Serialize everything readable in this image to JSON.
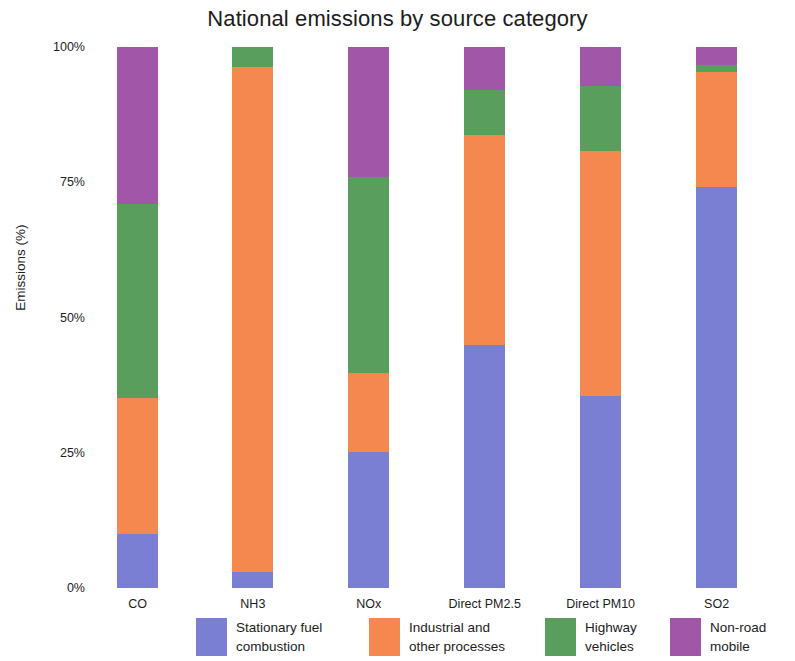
{
  "chart_data": {
    "type": "bar",
    "title": "National emissions by source category",
    "xlabel": "",
    "ylabel": "Emissions (%)",
    "stacked": true,
    "stack_mode": "percent",
    "grid": false,
    "legend_position": "bottom",
    "ylim": [
      0,
      100
    ],
    "yticks": [
      0,
      25,
      50,
      75,
      100
    ],
    "ytick_labels": [
      "0%",
      "25%",
      "50%",
      "75%",
      "100%"
    ],
    "categories": [
      "CO",
      "NH3",
      "NOx",
      "Direct PM2.5",
      "Direct PM10",
      "SO2"
    ],
    "series": [
      {
        "name": "Stationary fuel\ncombustion",
        "legend_label": "Stationary fuel\ncombustion",
        "color": "#7b7fd4",
        "values": [
          10.0,
          3.0,
          25.2,
          44.9,
          35.5,
          74.1
        ]
      },
      {
        "name": "Industrial and\nother processes",
        "legend_label": "Industrial and\nother processes",
        "color": "#f5884f",
        "values": [
          25.2,
          93.3,
          14.6,
          38.8,
          45.3,
          21.2
        ]
      },
      {
        "name": "Highway\nvehicles",
        "legend_label": "Highway\nvehicles",
        "color": "#5a9e5e",
        "values": [
          35.7,
          3.7,
          36.1,
          8.3,
          12.0,
          1.3
        ]
      },
      {
        "name": "Non-road\nmobile",
        "legend_label": "Non-road\nmobile",
        "color": "#a256a8",
        "values": [
          29.1,
          0.0,
          24.1,
          8.0,
          7.2,
          3.4
        ]
      }
    ]
  }
}
